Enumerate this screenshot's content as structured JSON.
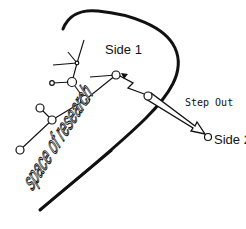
{
  "diagram": {
    "labels": {
      "side1": "Side 1",
      "side2": "Side 2",
      "step_out": "Step Out",
      "space": "space of research"
    },
    "colors": {
      "line": "#111111",
      "background": "#ffffff",
      "node_fill": "#ffffff"
    },
    "nodes": [
      {
        "id": "n1",
        "x": 77,
        "y": 63
      },
      {
        "id": "n2",
        "x": 72,
        "y": 82
      },
      {
        "id": "n3",
        "x": 85,
        "y": 100
      },
      {
        "id": "n4",
        "x": 52,
        "y": 83
      },
      {
        "id": "n5",
        "x": 40,
        "y": 108
      },
      {
        "id": "n6",
        "x": 52,
        "y": 120
      },
      {
        "id": "n7",
        "x": 20,
        "y": 150
      },
      {
        "id": "n8",
        "x": 116,
        "y": 75
      },
      {
        "id": "n9",
        "x": 148,
        "y": 96
      },
      {
        "id": "n10",
        "x": 208,
        "y": 137
      }
    ]
  }
}
